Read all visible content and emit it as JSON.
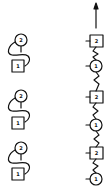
{
  "diagram": {
    "stroke_color": "#111111",
    "background": "#ffffff",
    "left_column": {
      "units": [
        {
          "circle_label": "2",
          "square_label": "1"
        },
        {
          "circle_label": "2",
          "square_label": "1"
        },
        {
          "circle_label": "2",
          "square_label": "1"
        }
      ]
    },
    "right_column": {
      "arrow": "up-arrow",
      "chain": [
        {
          "shape": "square",
          "label": "2"
        },
        {
          "shape": "circle",
          "label": "1"
        },
        {
          "shape": "square",
          "label": "2"
        },
        {
          "shape": "circle",
          "label": "1"
        },
        {
          "shape": "square",
          "label": "2"
        },
        {
          "shape": "circle",
          "label": "1"
        }
      ]
    }
  }
}
